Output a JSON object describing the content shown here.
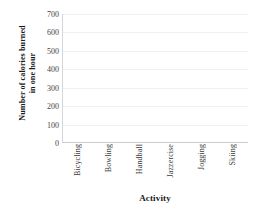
{
  "chart_data": {
    "type": "bar",
    "title": "",
    "subtitle": "",
    "xlabel": "Activity",
    "ylabel": "Number of calories burned in one hour",
    "ylabel_lines": [
      "Number of calories burned",
      "in one hour"
    ],
    "categories": [
      "Bicycling",
      "Bowling",
      "Handball",
      "Jazzercise",
      "Jogging",
      "Skiing"
    ],
    "values": [
      null,
      null,
      null,
      null,
      null,
      null
    ],
    "series": [
      {
        "name": "",
        "values": [
          null,
          null,
          null,
          null,
          null,
          null
        ]
      }
    ],
    "ylim": [
      0,
      700
    ],
    "ytick_interval": 100,
    "ytick_labels": [
      "700",
      "600",
      "500",
      "400",
      "300",
      "200",
      "100",
      "0"
    ],
    "ytick_values": [
      700,
      600,
      500,
      400,
      300,
      200,
      100,
      0
    ],
    "grid": "horizontal",
    "legend": "none",
    "legend_position": "",
    "annotations": [],
    "note": "empty plot area - no bars drawn, blank grid template"
  },
  "colors": {
    "background": "#ffffff",
    "gridline": "#f0f0f3",
    "axis_line": "#d6d6da",
    "tick_text": "#444444",
    "title_text": "#1a1a1a"
  }
}
